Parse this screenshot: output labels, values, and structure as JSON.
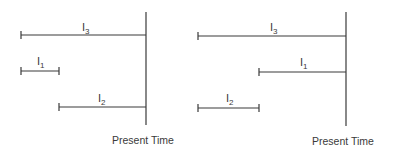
{
  "diagrams": [
    {
      "present_label": "Present Time",
      "intervals": [
        {
          "name": "I",
          "sub": "3"
        },
        {
          "name": "I",
          "sub": "1"
        },
        {
          "name": "I",
          "sub": "2"
        }
      ]
    },
    {
      "present_label": "Present Time",
      "intervals": [
        {
          "name": "I",
          "sub": "3"
        },
        {
          "name": "I",
          "sub": "1"
        },
        {
          "name": "I",
          "sub": "2"
        }
      ]
    }
  ],
  "colors": {
    "line": "#3a3a3a",
    "background": "#ffffff"
  }
}
